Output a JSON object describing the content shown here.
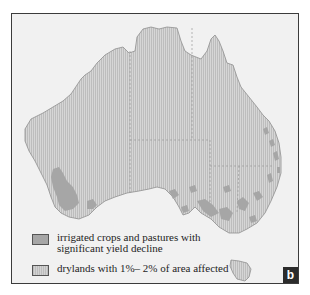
{
  "figure": {
    "panel_label": "b",
    "colors": {
      "frame_background": "#f1f1f1",
      "land_hatch_light": "#d4d4d4",
      "land_hatch_dark": "#bcbcbc",
      "irrigated_fill": "#a6a6a6",
      "border": "#3c3c3c",
      "badge": "#2b2b2b"
    }
  },
  "legend": {
    "items": [
      {
        "symbol": "solid-gray-swatch",
        "label_line1": "irrigated crops and pastures with",
        "label_line2": "significant yield decline"
      },
      {
        "symbol": "hatched-gray-swatch",
        "label_line1": "drylands with 1%– 2% of area affected"
      }
    ]
  }
}
